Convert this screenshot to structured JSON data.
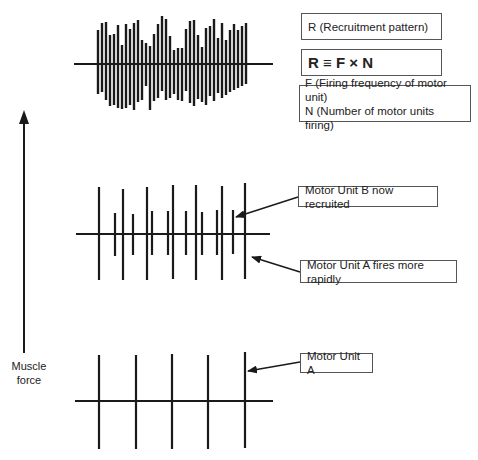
{
  "labels": {
    "recruitment_pattern": "R (Recruitment pattern)",
    "formula": "R ≡ F × N",
    "definition_f": "F (Firing frequency of motor unit)",
    "definition_n": "N (Number of motor units firing)",
    "motor_unit_b": "Motor Unit B now recruited",
    "motor_unit_a_rapid": "Motor Unit A fires more rapidly",
    "motor_unit_a": "Motor Unit A",
    "axis_line1": "Muscle",
    "axis_line2": "force"
  },
  "colors": {
    "ink": "#1a1a1a",
    "box_border": "#555555",
    "background": "#ffffff"
  },
  "waveforms": {
    "bottom": {
      "baseline": {
        "y": 401,
        "x1": 75,
        "x2": 273
      },
      "spikes": [
        {
          "x": 99,
          "top": 355,
          "bottom": 449
        },
        {
          "x": 136,
          "top": 355,
          "bottom": 449
        },
        {
          "x": 172,
          "top": 354,
          "bottom": 449
        },
        {
          "x": 208,
          "top": 355,
          "bottom": 449
        },
        {
          "x": 245,
          "top": 352,
          "bottom": 448
        }
      ]
    },
    "middle": {
      "baseline": {
        "y": 234,
        "x1": 76,
        "x2": 270
      },
      "spikes": [
        {
          "x": 99,
          "top": 187,
          "bottom": 280
        },
        {
          "x": 115,
          "top": 213,
          "bottom": 256
        },
        {
          "x": 123,
          "top": 189,
          "bottom": 280
        },
        {
          "x": 133,
          "top": 214,
          "bottom": 255
        },
        {
          "x": 147,
          "top": 187,
          "bottom": 280
        },
        {
          "x": 152,
          "top": 211,
          "bottom": 255
        },
        {
          "x": 168,
          "top": 211,
          "bottom": 255
        },
        {
          "x": 173,
          "top": 185,
          "bottom": 279
        },
        {
          "x": 186,
          "top": 211,
          "bottom": 255
        },
        {
          "x": 196,
          "top": 185,
          "bottom": 280
        },
        {
          "x": 202,
          "top": 212,
          "bottom": 255
        },
        {
          "x": 217,
          "top": 210,
          "bottom": 255
        },
        {
          "x": 222,
          "top": 186,
          "bottom": 280
        },
        {
          "x": 233,
          "top": 210,
          "bottom": 254
        },
        {
          "x": 245,
          "top": 183,
          "bottom": 279
        }
      ]
    },
    "top": {
      "baseline": {
        "y": 64,
        "x1": 74,
        "x2": 273
      },
      "spikes": [
        {
          "x": 98,
          "top": 30,
          "bottom": 94
        },
        {
          "x": 102,
          "top": 23,
          "bottom": 92
        },
        {
          "x": 106,
          "top": 22,
          "bottom": 100
        },
        {
          "x": 110,
          "top": 35,
          "bottom": 106
        },
        {
          "x": 114,
          "top": 34,
          "bottom": 105
        },
        {
          "x": 118,
          "top": 25,
          "bottom": 108
        },
        {
          "x": 122,
          "top": 45,
          "bottom": 109
        },
        {
          "x": 126,
          "top": 24,
          "bottom": 108
        },
        {
          "x": 130,
          "top": 29,
          "bottom": 105
        },
        {
          "x": 134,
          "top": 23,
          "bottom": 110
        },
        {
          "x": 138,
          "top": 20,
          "bottom": 102
        },
        {
          "x": 142,
          "top": 40,
          "bottom": 100
        },
        {
          "x": 146,
          "top": 43,
          "bottom": 86
        },
        {
          "x": 150,
          "top": 46,
          "bottom": 110
        },
        {
          "x": 154,
          "top": 34,
          "bottom": 101
        },
        {
          "x": 158,
          "top": 24,
          "bottom": 98
        },
        {
          "x": 162,
          "top": 16,
          "bottom": 91
        },
        {
          "x": 166,
          "top": 19,
          "bottom": 100
        },
        {
          "x": 170,
          "top": 36,
          "bottom": 98
        },
        {
          "x": 174,
          "top": 50,
          "bottom": 94
        },
        {
          "x": 178,
          "top": 48,
          "bottom": 100
        },
        {
          "x": 182,
          "top": 48,
          "bottom": 101
        },
        {
          "x": 186,
          "top": 29,
          "bottom": 91
        },
        {
          "x": 190,
          "top": 21,
          "bottom": 103
        },
        {
          "x": 194,
          "top": 20,
          "bottom": 106
        },
        {
          "x": 198,
          "top": 35,
          "bottom": 99
        },
        {
          "x": 202,
          "top": 47,
          "bottom": 102
        },
        {
          "x": 206,
          "top": 28,
          "bottom": 105
        },
        {
          "x": 210,
          "top": 26,
          "bottom": 96
        },
        {
          "x": 214,
          "top": 19,
          "bottom": 101
        },
        {
          "x": 218,
          "top": 38,
          "bottom": 93
        },
        {
          "x": 222,
          "top": 23,
          "bottom": 98
        },
        {
          "x": 226,
          "top": 40,
          "bottom": 95
        },
        {
          "x": 230,
          "top": 30,
          "bottom": 92
        },
        {
          "x": 234,
          "top": 24,
          "bottom": 90
        },
        {
          "x": 238,
          "top": 30,
          "bottom": 88
        },
        {
          "x": 242,
          "top": 26,
          "bottom": 86
        },
        {
          "x": 246,
          "top": 23,
          "bottom": 84
        }
      ]
    }
  },
  "axis_arrow": {
    "x": 24,
    "tip_y": 110,
    "tail_y": 353
  },
  "callouts": {
    "motor_unit_b": {
      "from": [
        298,
        197
      ],
      "to": [
        236,
        217
      ]
    },
    "motor_unit_a_rapid": {
      "from": [
        300,
        272
      ],
      "to": [
        252,
        257
      ]
    },
    "motor_unit_a": {
      "from": [
        300,
        362
      ],
      "to": [
        248,
        371
      ]
    }
  }
}
